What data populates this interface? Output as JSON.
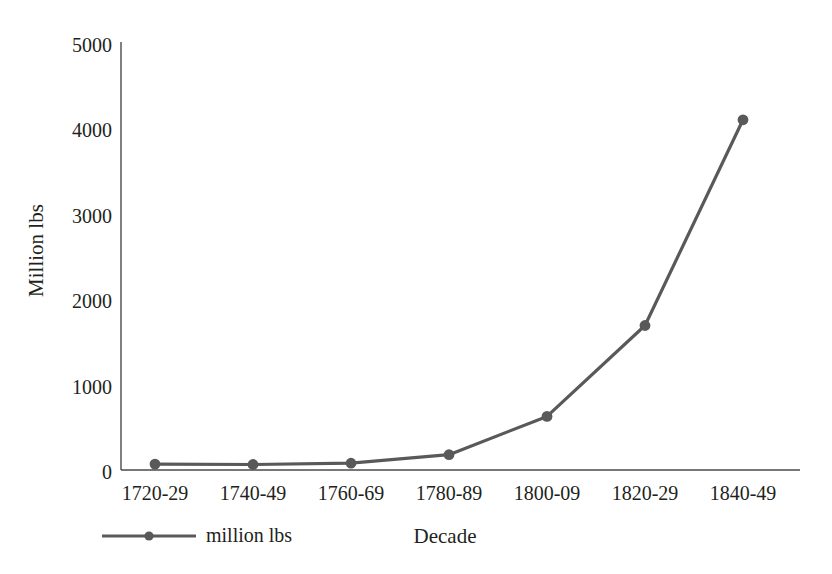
{
  "chart_data": {
    "type": "line",
    "title": "",
    "subtitle": "",
    "xlabel": "Decade",
    "ylabel": "Million lbs",
    "categories": [
      "1720-29",
      "1740-49",
      "1760-69",
      "1780-89",
      "1800-09",
      "1820-29",
      "1840-49"
    ],
    "series": [
      {
        "name": "million lbs",
        "values": [
          70,
          65,
          80,
          180,
          630,
          1700,
          4120
        ]
      }
    ],
    "ytick_labels": [
      "5000",
      "4000",
      "3000",
      "2000",
      "1000",
      "0"
    ],
    "ytick_values": [
      5000,
      4000,
      3000,
      2000,
      1000,
      0
    ],
    "ylim": [
      0,
      5000
    ],
    "grid": false,
    "legend": {
      "position": "bottom-left",
      "entries": [
        "million lbs"
      ]
    },
    "marker": "circle",
    "colors": {
      "series_line": "#595959",
      "series_marker": "#595959",
      "axis": "#3f3f3f",
      "text": "#231f20",
      "background": "#ffffff"
    }
  },
  "axis": {
    "y_title": "Million lbs",
    "x_title": "Decade"
  },
  "legend": {
    "series_label": "million lbs"
  }
}
